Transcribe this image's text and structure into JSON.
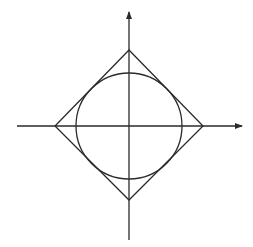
{
  "diagram": {
    "canvas": {
      "width": 253,
      "height": 247,
      "background": "#ffffff"
    },
    "stroke_color": "#2a2a2a",
    "origin": {
      "x": 129,
      "y": 126
    },
    "x_axis": {
      "x1": 17,
      "x2": 242,
      "y": 126,
      "arrow": "right"
    },
    "y_axis": {
      "x": 129,
      "y1": 240,
      "y2": 12,
      "arrow": "up"
    },
    "diamond": {
      "top": {
        "x": 129,
        "y": 50
      },
      "right": {
        "x": 203,
        "y": 126
      },
      "bottom": {
        "x": 129,
        "y": 200
      },
      "left": {
        "x": 55,
        "y": 126
      }
    },
    "circle": {
      "cx": 129,
      "cy": 126,
      "r": 53
    }
  }
}
